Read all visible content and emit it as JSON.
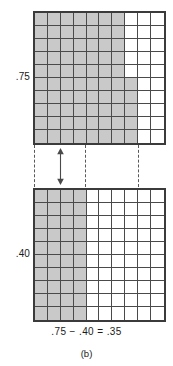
{
  "figure": {
    "caption": "(b)",
    "equation": ".75 − .40 = .35",
    "minuend_label": ".75",
    "subtrahend_label": ".40"
  },
  "colors": {
    "shaded_cell": "#c9c9c9",
    "empty_cell": "#ffffff",
    "grid_line": "#4a4a4a",
    "grid_border": "#3b3b3b",
    "dashed_guide": "#595959",
    "text": "#1a1a1a",
    "background": "#ffffff"
  },
  "chart_data": {
    "type": "heatmap",
    "title": ".75 − .40 = .35",
    "subtitle": "(b)",
    "xlabel": "",
    "ylabel": "",
    "grid": true,
    "legend_position": "none",
    "cell_total": 100,
    "rows": 10,
    "columns": 10,
    "series": [
      {
        "name": ".75",
        "label": ".75",
        "shaded_count": 75,
        "value": 0.75,
        "full_shaded_columns": 7,
        "partial_column_index": 8,
        "partial_column_shaded_rows": [
          6,
          7,
          8,
          9,
          10
        ],
        "matrix": [
          [
            1,
            1,
            1,
            1,
            1,
            1,
            1,
            0,
            0,
            0
          ],
          [
            1,
            1,
            1,
            1,
            1,
            1,
            1,
            0,
            0,
            0
          ],
          [
            1,
            1,
            1,
            1,
            1,
            1,
            1,
            0,
            0,
            0
          ],
          [
            1,
            1,
            1,
            1,
            1,
            1,
            1,
            0,
            0,
            0
          ],
          [
            1,
            1,
            1,
            1,
            1,
            1,
            1,
            0,
            0,
            0
          ],
          [
            1,
            1,
            1,
            1,
            1,
            1,
            1,
            1,
            0,
            0
          ],
          [
            1,
            1,
            1,
            1,
            1,
            1,
            1,
            1,
            0,
            0
          ],
          [
            1,
            1,
            1,
            1,
            1,
            1,
            1,
            1,
            0,
            0
          ],
          [
            1,
            1,
            1,
            1,
            1,
            1,
            1,
            1,
            0,
            0
          ],
          [
            1,
            1,
            1,
            1,
            1,
            1,
            1,
            1,
            0,
            0
          ]
        ]
      },
      {
        "name": ".40",
        "label": ".40",
        "shaded_count": 40,
        "value": 0.4,
        "full_shaded_columns": 4,
        "partial_column_index": null,
        "partial_column_shaded_rows": [],
        "matrix": [
          [
            1,
            1,
            1,
            1,
            0,
            0,
            0,
            0,
            0,
            0
          ],
          [
            1,
            1,
            1,
            1,
            0,
            0,
            0,
            0,
            0,
            0
          ],
          [
            1,
            1,
            1,
            1,
            0,
            0,
            0,
            0,
            0,
            0
          ],
          [
            1,
            1,
            1,
            1,
            0,
            0,
            0,
            0,
            0,
            0
          ],
          [
            1,
            1,
            1,
            1,
            0,
            0,
            0,
            0,
            0,
            0
          ],
          [
            1,
            1,
            1,
            1,
            0,
            0,
            0,
            0,
            0,
            0
          ],
          [
            1,
            1,
            1,
            1,
            0,
            0,
            0,
            0,
            0,
            0
          ],
          [
            1,
            1,
            1,
            1,
            0,
            0,
            0,
            0,
            0,
            0
          ],
          [
            1,
            1,
            1,
            1,
            0,
            0,
            0,
            0,
            0,
            0
          ],
          [
            1,
            1,
            1,
            1,
            0,
            0,
            0,
            0,
            0,
            0
          ]
        ]
      }
    ],
    "difference": {
      "label": ".35",
      "value": 0.35,
      "shaded_count": 35
    },
    "annotations": [
      {
        "name": "gap-arrow",
        "kind": "double-headed-vertical-arrow"
      },
      {
        "name": "guide-line-left",
        "kind": "dashed-vertical"
      },
      {
        "name": "guide-line-middle",
        "kind": "dashed-vertical"
      },
      {
        "name": "guide-line-right",
        "kind": "dashed-vertical"
      }
    ]
  }
}
